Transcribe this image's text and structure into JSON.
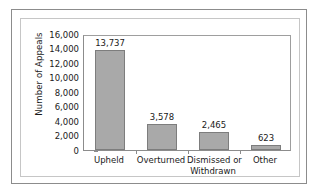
{
  "chart_data": {
    "type": "bar",
    "title": "",
    "xlabel": "",
    "ylabel": "Number of Appeals",
    "categories": [
      "Upheld",
      "Overturned",
      "Dismissed or Withdrawn",
      "Other"
    ],
    "category_lines": [
      [
        "Upheld"
      ],
      [
        "Overturned"
      ],
      [
        "Dismissed or",
        "Withdrawn"
      ],
      [
        "Other"
      ]
    ],
    "values": [
      13737,
      3578,
      2465,
      623
    ],
    "value_labels": [
      "13,737",
      "3,578",
      "2,465",
      "623"
    ],
    "ylim": [
      0,
      16000
    ],
    "ytick_values": [
      0,
      2000,
      4000,
      6000,
      8000,
      10000,
      12000,
      14000,
      16000
    ],
    "ytick_labels": [
      "0",
      "2,000",
      "4,000",
      "6,000",
      "8,000",
      "10,000",
      "12,000",
      "14,000",
      "16,000"
    ],
    "grid": false,
    "legend": false,
    "bar_color": "#a9a9a9",
    "bar_border_color": "#7d7d7d",
    "axis_color": "#8c8c8c",
    "text_color": "#1a1a1a",
    "background": "#ffffff"
  }
}
